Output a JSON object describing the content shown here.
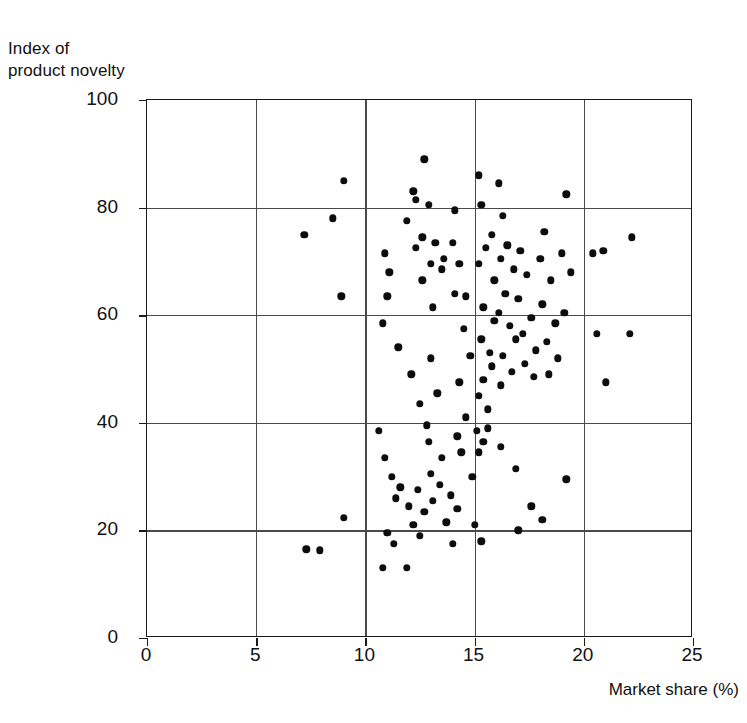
{
  "chart_data": {
    "type": "scatter",
    "title": "",
    "xlabel": "Market share (%)",
    "ylabel_lines": [
      "Index of",
      "product novelty"
    ],
    "xlim": [
      0,
      25
    ],
    "ylim": [
      0,
      100
    ],
    "xticks": [
      0,
      5,
      10,
      15,
      20,
      25
    ],
    "yticks": [
      0,
      20,
      40,
      60,
      80,
      100
    ],
    "grid": true,
    "legend": "none",
    "marker": {
      "shape": "circle",
      "color": "#0d0d0d",
      "size_px": 7.4
    },
    "n_points": 124,
    "points": [
      [
        9.0,
        85.0
      ],
      [
        8.5,
        78.0
      ],
      [
        7.2,
        75.0
      ],
      [
        8.9,
        63.5
      ],
      [
        10.9,
        71.5
      ],
      [
        11.1,
        68.0
      ],
      [
        10.8,
        58.5
      ],
      [
        11.5,
        54.0
      ],
      [
        12.2,
        83.0
      ],
      [
        11.9,
        77.5
      ],
      [
        12.3,
        72.5
      ],
      [
        12.6,
        74.5
      ],
      [
        11.0,
        63.5
      ],
      [
        12.3,
        81.5
      ],
      [
        12.7,
        89.0
      ],
      [
        12.9,
        80.5
      ],
      [
        13.2,
        73.5
      ],
      [
        13.5,
        68.5
      ],
      [
        13.0,
        69.5
      ],
      [
        13.6,
        70.5
      ],
      [
        12.6,
        66.5
      ],
      [
        13.1,
        61.5
      ],
      [
        12.1,
        49.0
      ],
      [
        13.0,
        52.0
      ],
      [
        13.3,
        45.5
      ],
      [
        12.5,
        43.5
      ],
      [
        12.8,
        39.5
      ],
      [
        12.9,
        36.5
      ],
      [
        13.5,
        33.5
      ],
      [
        13.0,
        30.5
      ],
      [
        14.1,
        79.5
      ],
      [
        14.0,
        73.5
      ],
      [
        14.3,
        69.5
      ],
      [
        14.1,
        64.0
      ],
      [
        14.6,
        63.5
      ],
      [
        14.5,
        57.5
      ],
      [
        14.8,
        52.5
      ],
      [
        14.3,
        47.5
      ],
      [
        14.6,
        41.0
      ],
      [
        14.2,
        37.5
      ],
      [
        14.4,
        34.5
      ],
      [
        14.9,
        30.0
      ],
      [
        15.2,
        86.0
      ],
      [
        15.3,
        80.5
      ],
      [
        15.8,
        75.0
      ],
      [
        15.5,
        72.5
      ],
      [
        15.2,
        69.5
      ],
      [
        15.9,
        66.5
      ],
      [
        15.4,
        61.5
      ],
      [
        15.9,
        59.0
      ],
      [
        15.3,
        55.5
      ],
      [
        15.7,
        53.0
      ],
      [
        15.8,
        50.5
      ],
      [
        15.4,
        48.0
      ],
      [
        15.2,
        45.0
      ],
      [
        15.6,
        42.5
      ],
      [
        16.1,
        84.5
      ],
      [
        16.3,
        78.5
      ],
      [
        16.5,
        73.0
      ],
      [
        16.2,
        70.5
      ],
      [
        16.8,
        68.5
      ],
      [
        16.4,
        64.0
      ],
      [
        16.1,
        60.5
      ],
      [
        16.6,
        58.0
      ],
      [
        16.9,
        55.5
      ],
      [
        16.3,
        52.5
      ],
      [
        16.7,
        49.5
      ],
      [
        16.2,
        47.0
      ],
      [
        17.1,
        72.0
      ],
      [
        17.4,
        67.5
      ],
      [
        17.0,
        63.0
      ],
      [
        17.6,
        59.5
      ],
      [
        17.2,
        56.5
      ],
      [
        17.8,
        53.5
      ],
      [
        17.3,
        51.0
      ],
      [
        17.7,
        48.5
      ],
      [
        18.2,
        75.5
      ],
      [
        18.0,
        70.5
      ],
      [
        18.5,
        66.5
      ],
      [
        18.1,
        62.0
      ],
      [
        18.7,
        58.5
      ],
      [
        18.3,
        55.0
      ],
      [
        18.8,
        52.0
      ],
      [
        18.4,
        49.0
      ],
      [
        19.2,
        82.5
      ],
      [
        19.0,
        71.5
      ],
      [
        19.4,
        68.0
      ],
      [
        19.1,
        60.5
      ],
      [
        20.4,
        71.5
      ],
      [
        20.9,
        72.0
      ],
      [
        20.6,
        56.5
      ],
      [
        21.0,
        47.5
      ],
      [
        22.2,
        74.5
      ],
      [
        22.1,
        56.5
      ],
      [
        7.3,
        16.5
      ],
      [
        7.9,
        16.3
      ],
      [
        9.0,
        22.3
      ],
      [
        10.6,
        38.5
      ],
      [
        10.9,
        33.5
      ],
      [
        11.2,
        30.0
      ],
      [
        11.4,
        26.0
      ],
      [
        11.0,
        19.5
      ],
      [
        11.3,
        17.5
      ],
      [
        10.8,
        13.0
      ],
      [
        11.9,
        13.0
      ],
      [
        11.6,
        28.0
      ],
      [
        12.0,
        24.5
      ],
      [
        12.4,
        27.5
      ],
      [
        12.7,
        23.5
      ],
      [
        13.1,
        25.5
      ],
      [
        13.4,
        28.5
      ],
      [
        12.2,
        21.0
      ],
      [
        12.5,
        19.0
      ],
      [
        13.7,
        21.5
      ],
      [
        13.9,
        26.5
      ],
      [
        14.2,
        24.0
      ],
      [
        14.0,
        17.5
      ],
      [
        15.1,
        38.5
      ],
      [
        15.4,
        36.5
      ],
      [
        15.2,
        34.5
      ],
      [
        15.6,
        39.0
      ],
      [
        15.0,
        21.0
      ],
      [
        15.3,
        18.0
      ],
      [
        16.2,
        35.5
      ],
      [
        16.9,
        31.5
      ],
      [
        17.6,
        24.5
      ],
      [
        18.1,
        22.0
      ],
      [
        19.2,
        29.5
      ],
      [
        17.0,
        20.0
      ]
    ]
  },
  "axis": {
    "x_tick_labels": [
      "0",
      "5",
      "10",
      "15",
      "20",
      "25"
    ],
    "y_tick_labels": [
      "0",
      "20",
      "40",
      "60",
      "80",
      "100"
    ]
  }
}
